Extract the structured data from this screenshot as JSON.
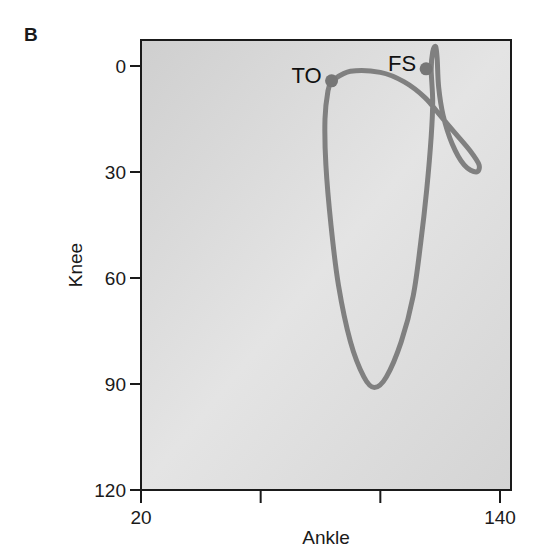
{
  "panel_label": "B",
  "chart_data": {
    "type": "line",
    "title": "",
    "xlabel": "Ankle",
    "ylabel": "Knee",
    "xlim": [
      20,
      140
    ],
    "ylim": [
      120,
      0
    ],
    "y_inverted": true,
    "grid": false,
    "x_ticks": [
      20,
      60,
      100,
      140
    ],
    "x_tick_labels": [
      "20",
      "",
      "",
      "140"
    ],
    "y_ticks": [
      0,
      30,
      60,
      90,
      120
    ],
    "y_tick_labels": [
      "0",
      "30",
      "60",
      "90",
      "120"
    ],
    "series": [
      {
        "name": "knee-ankle cycle",
        "color": "#808080",
        "points": [
          [
            83.7,
            4.2
          ],
          [
            90,
            1.5
          ],
          [
            100,
            1.8
          ],
          [
            108,
            4.5
          ],
          [
            115,
            9
          ],
          [
            120,
            14
          ],
          [
            125,
            19
          ],
          [
            130,
            24
          ],
          [
            133,
            28
          ],
          [
            132,
            30
          ],
          [
            128,
            28
          ],
          [
            124,
            22
          ],
          [
            121,
            14
          ],
          [
            119.5,
            6
          ],
          [
            119,
            -2
          ],
          [
            118.5,
            -5.5
          ],
          [
            117.5,
            -4
          ],
          [
            117,
            1
          ],
          [
            117.5,
            10
          ],
          [
            117,
            20
          ],
          [
            115.5,
            35
          ],
          [
            113.5,
            50
          ],
          [
            111,
            65
          ],
          [
            107,
            78
          ],
          [
            102,
            88
          ],
          [
            98,
            91
          ],
          [
            94.5,
            88
          ],
          [
            90,
            78
          ],
          [
            86,
            62
          ],
          [
            83.5,
            45
          ],
          [
            81.8,
            28
          ],
          [
            81.5,
            15
          ],
          [
            82.5,
            7
          ],
          [
            83.7,
            4.2
          ]
        ]
      }
    ],
    "annotations": [
      {
        "label": "TO",
        "ankle": 83.7,
        "knee": 4.2,
        "marker": "dot"
      },
      {
        "label": "FS",
        "ankle": 115.3,
        "knee": 0.8,
        "marker": "dot"
      }
    ],
    "background": "#d6d6d6"
  }
}
